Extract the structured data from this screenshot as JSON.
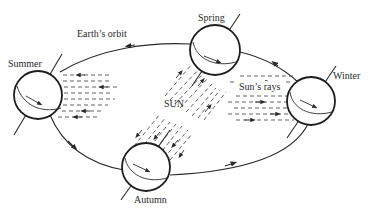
{
  "diagram": {
    "type": "seasons-earth-orbit",
    "labels": {
      "orbit": "Earth’s orbit",
      "sun": "SUN",
      "rays": "Sun’s rays"
    },
    "seasons": [
      {
        "name": "Summer",
        "position": "left"
      },
      {
        "name": "Spring",
        "position": "top"
      },
      {
        "name": "Winter",
        "position": "right"
      },
      {
        "name": "Autumn",
        "position": "bottom"
      }
    ],
    "colors": {
      "line": "#2a2a2a",
      "background": "#ffffff"
    }
  }
}
